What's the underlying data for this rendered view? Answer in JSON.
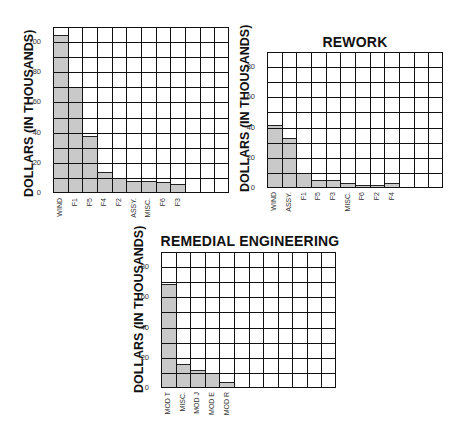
{
  "chart_data": [
    {
      "type": "bar",
      "title": "",
      "ylabel": "DOLLARS (IN THOUSANDS)",
      "xlabel": "",
      "ylim": [
        0,
        110
      ],
      "yticks": [
        0,
        20,
        40,
        60,
        80,
        100
      ],
      "grid": true,
      "grid_columns": 12,
      "grid_rows": 11,
      "categories": [
        "WIND",
        "F1",
        "F5",
        "F4",
        "F2",
        "ASSY.",
        "MISC.",
        "F6",
        "F3"
      ],
      "values": [
        105,
        70,
        38,
        14,
        10,
        8,
        8,
        7,
        6
      ]
    },
    {
      "type": "bar",
      "title": "REWORK",
      "ylabel": "DOLLARS (IN THOUSANDS)",
      "xlabel": "",
      "ylim": [
        0,
        90
      ],
      "yticks": [
        0,
        20,
        40,
        60,
        80
      ],
      "grid": true,
      "grid_columns": 12,
      "grid_rows": 9,
      "categories": [
        "WIND",
        "ASSY.",
        "F1",
        "F5",
        "F3",
        "MISC.",
        "F6",
        "F2",
        "F4"
      ],
      "values": [
        42,
        33,
        10,
        5,
        5,
        3,
        2,
        2,
        3
      ]
    },
    {
      "type": "bar",
      "title": "REMEDIAL ENGINEERING",
      "ylabel": "DOLLARS (IN THOUSANDS)",
      "xlabel": "",
      "ylim": [
        0,
        90
      ],
      "yticks": [
        0,
        20,
        40,
        60,
        80
      ],
      "grid": true,
      "grid_columns": 12,
      "grid_rows": 9,
      "categories": [
        "MOD T",
        "MISC.",
        "MOD J",
        "MOD E",
        "MOD R"
      ],
      "values": [
        69,
        16,
        12,
        10,
        4
      ]
    }
  ],
  "charts": [
    {
      "title": "",
      "ylabel": "DOLLARS (IN THOUSANDS)",
      "ticks": [
        "0",
        "20",
        "40",
        "60",
        "80",
        "100"
      ],
      "labels": [
        "WIND",
        "F1",
        "F5",
        "F4",
        "F2",
        "ASSY.",
        "MISC.",
        "F6",
        "F3"
      ]
    },
    {
      "title": "REWORK",
      "ylabel": "DOLLARS (IN THOUSANDS)",
      "ticks": [
        "0",
        "20",
        "40",
        "60",
        "80"
      ],
      "labels": [
        "WIND",
        "ASSY.",
        "F1",
        "F5",
        "F3",
        "MISC.",
        "F6",
        "F2",
        "F4"
      ]
    },
    {
      "title": "REMEDIAL ENGINEERING",
      "ylabel": "DOLLARS (IN THOUSANDS)",
      "ticks": [
        "0",
        "20",
        "40",
        "60",
        "80"
      ],
      "labels": [
        "MOD T",
        "MISC.",
        "MOD J",
        "MOD E",
        "MOD R"
      ]
    }
  ],
  "colors": {
    "bar_fill": "#c9c9c9",
    "grid_line": "#111111",
    "background": "#ffffff"
  }
}
